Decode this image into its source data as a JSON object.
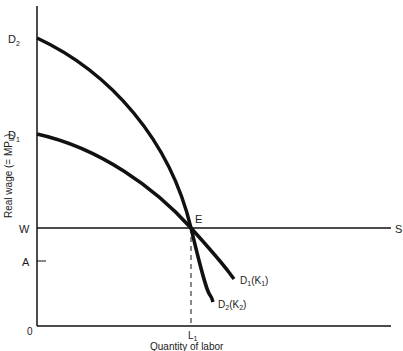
{
  "figure": {
    "type": "economics-diagram",
    "y_axis": {
      "label": "Real wage (= MP",
      "label_sub": "L",
      "label_close": ")"
    },
    "x_axis": {
      "label": "Quantity of labor"
    },
    "axis_labels": {
      "D2": {
        "main": "D",
        "sub": "2"
      },
      "D1": {
        "main": "D",
        "sub": "1"
      },
      "W": "W",
      "A": "A",
      "origin": "0",
      "L1": {
        "main": "L",
        "sub": "1"
      },
      "S": "S",
      "E": "E"
    },
    "curves": [
      {
        "name": "D1(K1)",
        "label": {
          "main": "D",
          "sub": "1",
          "paren": "(K",
          "paren_sub": "1",
          "close": ")"
        }
      },
      {
        "name": "D2(K2)",
        "label": {
          "main": "D",
          "sub": "2",
          "paren": "(K",
          "paren_sub": "2",
          "close": ")"
        }
      }
    ],
    "colors": {
      "line": "#111111",
      "background": "#ffffff"
    }
  }
}
